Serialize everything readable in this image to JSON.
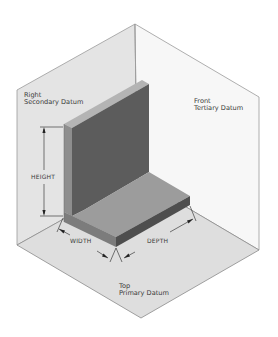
{
  "diagram": {
    "type": "isometric datum planes with L-bracket",
    "planes": [
      {
        "id": "right",
        "name": "Right",
        "role": "Secondary Datum"
      },
      {
        "id": "front",
        "name": "Front",
        "role": "Tertiary Datum"
      },
      {
        "id": "top",
        "name": "Top",
        "role": "Primary Datum"
      }
    ],
    "labels": {
      "right_line1": "Right",
      "right_line2": "Secondary Datum",
      "front_line1": "Front",
      "front_line2": "Tertiary Datum",
      "top_line1": "Top",
      "top_line2": "Primary Datum"
    },
    "dimensions": {
      "height": "HEIGHT",
      "width": "WIDTH",
      "depth": "DEPTH"
    },
    "colors": {
      "right_plane": "#e4e4e4",
      "front_plane": "#f7f7f7",
      "top_plane": "#dedede",
      "plane_edge": "#8a8a8a",
      "part_dark": "#5a5a5a",
      "part_mid": "#8c8c8c",
      "part_light": "#a8a8a8",
      "dim_line": "#222222"
    }
  }
}
